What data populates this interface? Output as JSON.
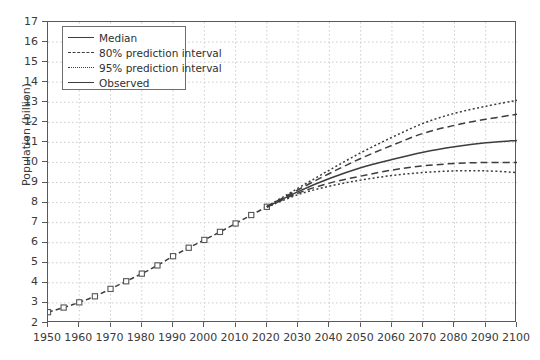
{
  "chart_data": {
    "type": "line",
    "title": "",
    "xlabel": "",
    "ylabel": "Population (billion)",
    "xlim": [
      1950,
      2100
    ],
    "ylim": [
      2,
      17
    ],
    "grid": true,
    "legend_position": "top-left",
    "xticks": [
      1950,
      1960,
      1970,
      1980,
      1990,
      2000,
      2010,
      2020,
      2030,
      2040,
      2050,
      2060,
      2070,
      2080,
      2090,
      2100
    ],
    "yticks": [
      2,
      3,
      4,
      5,
      6,
      7,
      8,
      9,
      10,
      11,
      12,
      13,
      14,
      15,
      16,
      17
    ],
    "legend": [
      {
        "label": "Median",
        "style": "solid"
      },
      {
        "label": "80% prediction interval",
        "style": "dashed"
      },
      {
        "label": "95% prediction interval",
        "style": "dotted"
      },
      {
        "label": "Observed",
        "style": "solid"
      }
    ],
    "series": [
      {
        "name": "Observed",
        "style": "dashed-with-markers",
        "marker": "open-square",
        "x": [
          1950,
          1955,
          1960,
          1965,
          1970,
          1975,
          1980,
          1985,
          1990,
          1995,
          2000,
          2005,
          2010,
          2015,
          2020
        ],
        "values": [
          2.54,
          2.77,
          3.03,
          3.33,
          3.7,
          4.08,
          4.46,
          4.87,
          5.33,
          5.75,
          6.14,
          6.54,
          6.96,
          7.38,
          7.79
        ]
      },
      {
        "name": "Median",
        "style": "solid",
        "x": [
          2020,
          2030,
          2040,
          2050,
          2060,
          2070,
          2080,
          2090,
          2100
        ],
        "values": [
          7.79,
          8.55,
          9.2,
          9.74,
          10.15,
          10.51,
          10.78,
          10.98,
          11.1
        ]
      },
      {
        "name": "80% prediction interval upper",
        "style": "dashed",
        "x": [
          2020,
          2030,
          2040,
          2050,
          2060,
          2070,
          2080,
          2090,
          2100
        ],
        "values": [
          7.8,
          8.64,
          9.45,
          10.2,
          10.85,
          11.45,
          11.85,
          12.15,
          12.4
        ]
      },
      {
        "name": "80% prediction interval lower",
        "style": "dashed",
        "x": [
          2020,
          2030,
          2040,
          2050,
          2060,
          2070,
          2080,
          2090,
          2100
        ],
        "values": [
          7.78,
          8.47,
          8.97,
          9.32,
          9.62,
          9.83,
          9.95,
          10.0,
          10.0
        ]
      },
      {
        "name": "95% prediction interval upper",
        "style": "dotted",
        "x": [
          2020,
          2030,
          2040,
          2050,
          2060,
          2070,
          2080,
          2090,
          2100
        ],
        "values": [
          7.81,
          8.72,
          9.62,
          10.48,
          11.25,
          11.95,
          12.45,
          12.8,
          13.1
        ]
      },
      {
        "name": "95% prediction interval lower",
        "style": "dotted",
        "x": [
          2020,
          2030,
          2040,
          2050,
          2060,
          2070,
          2080,
          2090,
          2100
        ],
        "values": [
          7.77,
          8.4,
          8.82,
          9.12,
          9.35,
          9.5,
          9.58,
          9.58,
          9.5
        ]
      }
    ],
    "colors": {
      "line": "#3d3d3d",
      "grid": "#c9c9c9",
      "axis": "#58595b",
      "background": "#ffffff",
      "text": "#3a3a3a"
    }
  }
}
